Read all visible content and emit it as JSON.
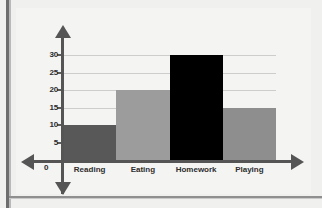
{
  "chart_data": {
    "type": "bar",
    "title": "",
    "xlabel": "",
    "ylabel": "",
    "categories": [
      "Reading",
      "Eating",
      "Homework",
      "Playing"
    ],
    "values": [
      10,
      20,
      30,
      15
    ],
    "series": [
      {
        "name": "Hours",
        "values": [
          10,
          20,
          30,
          15
        ]
      }
    ],
    "bar_colors": [
      "#585858",
      "#9c9c9c",
      "#000000",
      "#8e8e8e"
    ],
    "ylim": [
      0,
      30
    ],
    "ytick_labels": [
      "0",
      "5",
      "10",
      "15",
      "20",
      "25",
      "30"
    ],
    "ytick_values": [
      0,
      5,
      10,
      15,
      20,
      25,
      30
    ],
    "grid": true,
    "grid_axis": "y",
    "legend": false,
    "legend_position": "none",
    "axis_style": "double-headed-arrows",
    "origin_label": "0"
  },
  "colors": {
    "page_background": "#efefef",
    "plot_background": "#f4f4f3",
    "axis": "#555555",
    "gridline": "#cdcdcd",
    "text": "#2c2c2c",
    "left_rule": "#6d6d6d"
  }
}
